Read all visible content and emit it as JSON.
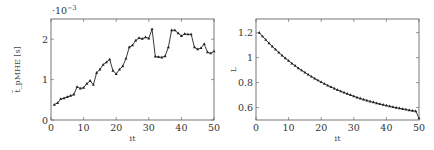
{
  "chart_data": [
    {
      "type": "line",
      "title": "",
      "xlabel": "it",
      "ylabel": "t̄_pMHE [s]",
      "y_scale_annotation": "·10^-3",
      "xlim": [
        0,
        50
      ],
      "ylim": [
        0,
        2.5
      ],
      "x_ticks": [
        "0",
        "10",
        "20",
        "30",
        "40",
        "50"
      ],
      "y_ticks": [
        "0",
        "1",
        "2"
      ],
      "grid": false,
      "legend": null,
      "marker": "triangle",
      "x": [
        1,
        2,
        3,
        4,
        5,
        6,
        7,
        8,
        9,
        10,
        11,
        12,
        13,
        14,
        15,
        16,
        17,
        18,
        19,
        20,
        21,
        22,
        23,
        24,
        25,
        26,
        27,
        28,
        29,
        30,
        31,
        32,
        33,
        34,
        35,
        36,
        37,
        38,
        39,
        40,
        41,
        42,
        43,
        44,
        45,
        46,
        47,
        48,
        49,
        50
      ],
      "series": [
        {
          "name": "t_pMHE",
          "unit_multiplier": 0.001,
          "values": [
            0.38,
            0.42,
            0.52,
            0.54,
            0.57,
            0.6,
            0.63,
            0.82,
            0.78,
            0.8,
            0.9,
            0.97,
            0.87,
            1.17,
            1.25,
            1.37,
            1.43,
            1.5,
            1.22,
            1.14,
            1.25,
            1.33,
            1.52,
            1.8,
            1.85,
            1.97,
            2.03,
            2.01,
            2.05,
            2.02,
            2.25,
            1.57,
            1.56,
            1.55,
            1.58,
            1.8,
            2.22,
            2.22,
            2.15,
            2.08,
            2.13,
            2.12,
            2.12,
            1.8,
            1.75,
            1.78,
            1.88,
            1.68,
            1.65,
            1.7
          ]
        }
      ]
    },
    {
      "type": "line",
      "title": "",
      "xlabel": "it",
      "ylabel": "L",
      "xlim": [
        0,
        50
      ],
      "ylim": [
        0.5,
        1.31
      ],
      "x_ticks": [
        "0",
        "10",
        "20",
        "30",
        "40",
        "50"
      ],
      "y_ticks": [
        "0.6",
        "0.8",
        "1",
        "1.2"
      ],
      "grid": false,
      "legend": null,
      "marker": "triangle",
      "x": [
        1,
        2,
        3,
        4,
        5,
        6,
        7,
        8,
        9,
        10,
        11,
        12,
        13,
        14,
        15,
        16,
        17,
        18,
        19,
        20,
        21,
        22,
        23,
        24,
        25,
        26,
        27,
        28,
        29,
        30,
        31,
        32,
        33,
        34,
        35,
        36,
        37,
        38,
        39,
        40,
        41,
        42,
        43,
        44,
        45,
        46,
        47,
        48,
        49,
        50
      ],
      "series": [
        {
          "name": "L",
          "values": [
            1.2,
            1.171,
            1.143,
            1.116,
            1.09,
            1.065,
            1.041,
            1.018,
            0.996,
            0.975,
            0.954,
            0.935,
            0.916,
            0.898,
            0.881,
            0.864,
            0.848,
            0.833,
            0.818,
            0.804,
            0.79,
            0.777,
            0.765,
            0.753,
            0.741,
            0.73,
            0.72,
            0.71,
            0.7,
            0.69,
            0.681,
            0.673,
            0.664,
            0.657,
            0.649,
            0.642,
            0.635,
            0.628,
            0.622,
            0.616,
            0.61,
            0.604,
            0.599,
            0.594,
            0.589,
            0.584,
            0.579,
            0.575,
            0.571,
            0.515
          ]
        }
      ]
    }
  ]
}
